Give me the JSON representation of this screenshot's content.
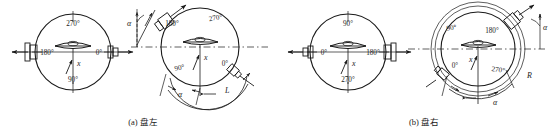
{
  "figure": {
    "title_visible": false,
    "background_color": "#ffffff",
    "line_color": "#1a1a1a",
    "panels": [
      {
        "id": "panel-a",
        "caption": "(a) 盘左",
        "views": [
          {
            "id": "panel-a-view-1",
            "name": "horizontal-circle-initial",
            "degree_labels": {
              "top": "270°",
              "left": "180°",
              "right": "0°",
              "bottom": "90°"
            },
            "index_label": "x"
          },
          {
            "id": "panel-a-view-2",
            "name": "horizontal-circle-rotated",
            "degree_labels": {
              "upper_right": "270°",
              "upper_left": "180°",
              "lower_left": "90°",
              "lower_right": "0°"
            },
            "index_label": "x",
            "angle_labels": [
              "α",
              "α"
            ],
            "arc_label": "L"
          }
        ]
      },
      {
        "id": "panel-b",
        "caption": "(b) 盘右",
        "views": [
          {
            "id": "panel-b-view-1",
            "name": "horizontal-circle-initial",
            "degree_labels": {
              "top": "90°",
              "left": "0°",
              "right": "180°",
              "bottom": "270°"
            },
            "index_label": "x"
          },
          {
            "id": "panel-b-view-2",
            "name": "horizontal-circle-rotated",
            "degree_labels": {
              "upper_left": "90°",
              "upper_right": "180°",
              "lower_left": "0°",
              "lower_right": "270°"
            },
            "index_label": "x",
            "angle_labels": [
              "α",
              "α"
            ],
            "arc_label": "R"
          }
        ]
      }
    ]
  }
}
